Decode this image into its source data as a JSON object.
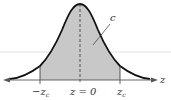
{
  "diagram": {
    "type": "standard-normal-curve",
    "axis_label": "z",
    "center_label": "z = 0",
    "left_label": "−z",
    "left_sub": "c",
    "right_label": "z",
    "right_sub": "c",
    "area_label": "c",
    "colors": {
      "shade": "#c8c8c8",
      "curve": "#111111",
      "axis": "#555555",
      "guide": "#dddddd"
    }
  }
}
